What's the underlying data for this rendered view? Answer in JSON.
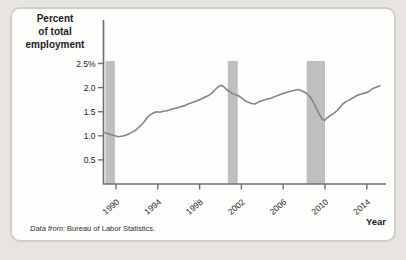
{
  "page": {
    "background": "#e8e5e0",
    "card_background": "#fdfdfc",
    "card_border": "#cfcecb"
  },
  "figure": {
    "y_axis_title_lines": [
      "Percent",
      "of total",
      "employment"
    ],
    "x_axis_title": "Year",
    "caption_prefix": "Data from",
    "caption_rest": ": Bureau of Labor Statistics."
  },
  "chart_data": {
    "type": "line",
    "title": "",
    "xlabel": "Year",
    "ylabel": "Percent of total employment",
    "grid": false,
    "legend": false,
    "xlim": [
      1988.85,
      2015.9
    ],
    "ylim": [
      0,
      2.6
    ],
    "x_ticks": [
      {
        "year": 1990,
        "label": "1990"
      },
      {
        "year": 1994,
        "label": "1994"
      },
      {
        "year": 1998,
        "label": "1998"
      },
      {
        "year": 2002,
        "label": "2002"
      },
      {
        "year": 2006,
        "label": "2006"
      },
      {
        "year": 2010,
        "label": "2010"
      },
      {
        "year": 2014,
        "label": "2014"
      }
    ],
    "y_ticks": [
      {
        "value": 2.5,
        "label": "2.5%"
      },
      {
        "value": 2.0,
        "label": "2.0"
      },
      {
        "value": 1.5,
        "label": "1.5"
      },
      {
        "value": 1.0,
        "label": "1.0"
      },
      {
        "value": 0.5,
        "label": "0.5"
      }
    ],
    "recession_bands": [
      [
        1989.0,
        1989.9
      ],
      [
        2000.7,
        2001.65
      ],
      [
        2008.25,
        2010.0
      ]
    ],
    "series": [
      {
        "name": "Percent of total employment",
        "points": [
          [
            1988.85,
            1.07
          ],
          [
            1989.2,
            1.05
          ],
          [
            1989.55,
            1.02
          ],
          [
            1989.9,
            1.0
          ],
          [
            1990.2,
            0.98
          ],
          [
            1990.5,
            0.99
          ],
          [
            1990.8,
            1.0
          ],
          [
            1991.1,
            1.03
          ],
          [
            1991.5,
            1.07
          ],
          [
            1991.9,
            1.12
          ],
          [
            1992.3,
            1.2
          ],
          [
            1992.7,
            1.29
          ],
          [
            1993.0,
            1.38
          ],
          [
            1993.3,
            1.44
          ],
          [
            1993.6,
            1.48
          ],
          [
            1993.9,
            1.5
          ],
          [
            1994.2,
            1.49
          ],
          [
            1994.5,
            1.51
          ],
          [
            1994.9,
            1.52
          ],
          [
            1995.3,
            1.55
          ],
          [
            1995.7,
            1.57
          ],
          [
            1996.1,
            1.6
          ],
          [
            1996.5,
            1.62
          ],
          [
            1996.9,
            1.66
          ],
          [
            1997.3,
            1.69
          ],
          [
            1997.7,
            1.72
          ],
          [
            1998.1,
            1.76
          ],
          [
            1998.5,
            1.8
          ],
          [
            1998.9,
            1.84
          ],
          [
            1999.2,
            1.89
          ],
          [
            1999.5,
            1.96
          ],
          [
            1999.8,
            2.02
          ],
          [
            2000.05,
            2.05
          ],
          [
            2000.3,
            2.02
          ],
          [
            2000.6,
            1.96
          ],
          [
            2000.9,
            1.91
          ],
          [
            2001.2,
            1.87
          ],
          [
            2001.5,
            1.85
          ],
          [
            2001.8,
            1.82
          ],
          [
            2002.1,
            1.77
          ],
          [
            2002.4,
            1.72
          ],
          [
            2002.7,
            1.69
          ],
          [
            2003.0,
            1.67
          ],
          [
            2003.3,
            1.66
          ],
          [
            2003.6,
            1.7
          ],
          [
            2003.9,
            1.72
          ],
          [
            2004.3,
            1.75
          ],
          [
            2004.8,
            1.78
          ],
          [
            2005.3,
            1.82
          ],
          [
            2005.8,
            1.86
          ],
          [
            2006.3,
            1.9
          ],
          [
            2006.8,
            1.93
          ],
          [
            2007.2,
            1.95
          ],
          [
            2007.45,
            1.96
          ],
          [
            2007.7,
            1.94
          ],
          [
            2008.0,
            1.91
          ],
          [
            2008.3,
            1.87
          ],
          [
            2008.6,
            1.8
          ],
          [
            2008.9,
            1.69
          ],
          [
            2009.2,
            1.56
          ],
          [
            2009.5,
            1.43
          ],
          [
            2009.75,
            1.34
          ],
          [
            2009.95,
            1.32
          ],
          [
            2010.2,
            1.37
          ],
          [
            2010.5,
            1.42
          ],
          [
            2010.8,
            1.46
          ],
          [
            2011.1,
            1.51
          ],
          [
            2011.4,
            1.58
          ],
          [
            2011.7,
            1.66
          ],
          [
            2012.0,
            1.71
          ],
          [
            2012.3,
            1.74
          ],
          [
            2012.7,
            1.79
          ],
          [
            2013.1,
            1.84
          ],
          [
            2013.5,
            1.87
          ],
          [
            2013.9,
            1.89
          ],
          [
            2014.2,
            1.92
          ],
          [
            2014.5,
            1.97
          ],
          [
            2014.8,
            2.0
          ],
          [
            2015.1,
            2.02
          ],
          [
            2015.25,
            2.04
          ]
        ]
      }
    ],
    "colors": {
      "line": "#858585",
      "band": "#bfbfbf",
      "axis": "#6e6e6e",
      "tick_label": "#242424"
    }
  }
}
